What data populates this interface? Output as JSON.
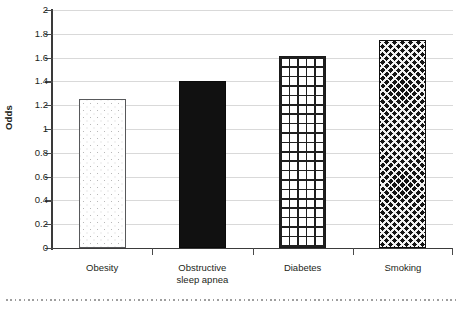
{
  "chart_data": {
    "type": "bar",
    "title": "",
    "xlabel": "",
    "ylabel": "Odds",
    "ylim": [
      0,
      2
    ],
    "ytick_step": 0.2,
    "ytick_labels": [
      "2",
      "1.8",
      "1.6",
      "1.4",
      "1.2",
      "1",
      "0.8",
      "0.6",
      "0.4",
      "0.2",
      "0"
    ],
    "grid": "horizontal",
    "legend": "none",
    "categories": [
      "Obesity",
      "Obstructive sleep apnea",
      "Diabetes",
      "Smoking"
    ],
    "category_label_lines": [
      [
        "Obesity"
      ],
      [
        "Obstructive",
        "sleep apnea"
      ],
      [
        "Diabetes"
      ],
      [
        "Smoking"
      ]
    ],
    "values": [
      1.25,
      1.4,
      1.61,
      1.75
    ],
    "series": [
      {
        "name": "Odds",
        "values": [
          1.25,
          1.4,
          1.61,
          1.75
        ],
        "point_fills": [
          "light-dotted",
          "solid-black",
          "square-grid",
          "dense-diamond-crosshatch"
        ]
      }
    ]
  },
  "axes": {
    "y_title": "Odds",
    "y_ticks": [
      {
        "label": "2",
        "value": 2
      },
      {
        "label": "1.8",
        "value": 1.8
      },
      {
        "label": "1.6",
        "value": 1.6
      },
      {
        "label": "1.4",
        "value": 1.4
      },
      {
        "label": "1.2",
        "value": 1.2
      },
      {
        "label": "1",
        "value": 1
      },
      {
        "label": "0.8",
        "value": 0.8
      },
      {
        "label": "0.6",
        "value": 0.6
      },
      {
        "label": "0.4",
        "value": 0.4
      },
      {
        "label": "0.2",
        "value": 0.2
      },
      {
        "label": "0",
        "value": 0
      }
    ]
  },
  "colors": {
    "axis": "#3a3a3a",
    "gridline": "#d9d9d9",
    "text": "#231f20",
    "bar_solid": "#111111",
    "bar_outline": "#58595b",
    "bottom_rule": "#9e9e9e"
  }
}
